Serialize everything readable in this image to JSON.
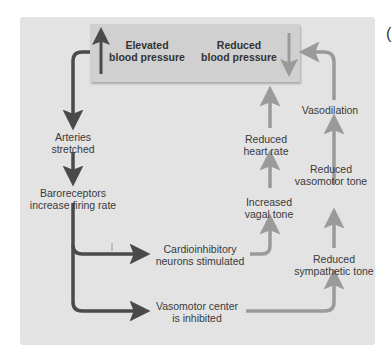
{
  "diagram": {
    "type": "flowchart",
    "colors": {
      "panel_bg": "#e3e3e3",
      "top_box_bg": "#d0d0d0",
      "dark_arrow": "#4a4a4a",
      "light_arrow": "#9a9a9a",
      "text": "#3a3a3a"
    },
    "top_box": {
      "elevated": {
        "line1": "Elevated",
        "line2": "blood pressure",
        "icon": "up-arrow-icon"
      },
      "reduced": {
        "line1": "Reduced",
        "line2": "blood pressure",
        "icon": "down-arrow-icon"
      }
    },
    "left_chain": [
      {
        "line1": "Arteries",
        "line2": "stretched"
      },
      {
        "line1": "Baroreceptors",
        "line2": "increase firing rate"
      }
    ],
    "branches": [
      {
        "line1": "Cardioinhibitory",
        "line2": "neurons stimulated"
      },
      {
        "line1": "Vasomotor center",
        "line2": "is inhibited"
      }
    ],
    "middle_chain": [
      {
        "line1": "Increased",
        "line2": "vagal tone"
      },
      {
        "line1": "Reduced",
        "line2": "heart rate"
      }
    ],
    "right_chain": [
      {
        "line1": "Reduced",
        "line2": "sympathetic tone"
      },
      {
        "line1": "Reduced",
        "line2": "vasomotor tone"
      },
      {
        "line1": "Vasodilation",
        "line2": ""
      }
    ],
    "edge_glyph": "("
  }
}
